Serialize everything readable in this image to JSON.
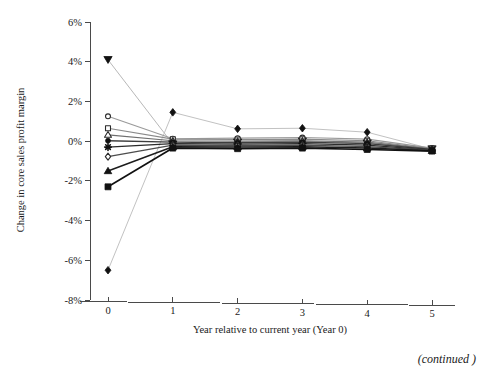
{
  "figure": {
    "continued_note": "(continued )"
  },
  "chart_data": {
    "type": "line",
    "title": "",
    "xlabel": "Year relative to current year (Year 0)",
    "ylabel": "Change in core sales profit margin",
    "x": [
      0,
      1,
      2,
      3,
      4,
      5
    ],
    "xtick_labels": [
      "0",
      "1",
      "2",
      "3",
      "4",
      "5"
    ],
    "xlim": [
      -0.25,
      5.35
    ],
    "ylim": [
      -8,
      6
    ],
    "ytick_values": [
      6,
      4,
      2,
      0,
      -2,
      -4,
      -6,
      -8
    ],
    "ytick_labels": [
      "6%",
      "4%",
      "2%",
      "0%",
      "-2%",
      "-4%",
      "-6%",
      "-8%"
    ],
    "grid": false,
    "legend": "none",
    "series": [
      {
        "name": "series-filled-down-triangle",
        "marker": "filled-down-triangle",
        "color": "#111111",
        "line_color": "#b8b8b8",
        "line_width": 1.0,
        "marker_size": 5.0,
        "values": [
          4.1,
          -0.15,
          -0.05,
          0.0,
          -0.1,
          -0.4
        ]
      },
      {
        "name": "series-filled-diamond",
        "marker": "filled-diamond",
        "color": "#111111",
        "line_color": "#c2c2c2",
        "line_width": 1.0,
        "marker_size": 4.6,
        "values": [
          -6.5,
          1.45,
          0.62,
          0.65,
          0.45,
          -0.4
        ]
      },
      {
        "name": "series-open-circle",
        "marker": "open-circle",
        "color": "#2a2a2a",
        "line_color": "#9a9a9a",
        "line_width": 1.1,
        "marker_size": 4.0,
        "values": [
          1.25,
          0.12,
          0.15,
          0.18,
          0.1,
          -0.35
        ]
      },
      {
        "name": "series-open-square",
        "marker": "open-square",
        "color": "#2a2a2a",
        "line_color": "#8a8a8a",
        "line_width": 1.1,
        "marker_size": 4.0,
        "values": [
          0.65,
          0.1,
          0.08,
          0.1,
          0.02,
          -0.38
        ]
      },
      {
        "name": "series-open-triangle",
        "marker": "open-triangle",
        "color": "#2a2a2a",
        "line_color": "#6f6f6f",
        "line_width": 1.2,
        "marker_size": 4.2,
        "values": [
          0.32,
          0.02,
          0.0,
          0.02,
          -0.05,
          -0.4
        ]
      },
      {
        "name": "series-filled-circle",
        "marker": "filled-circle",
        "color": "#111111",
        "line_color": "#3d3d3d",
        "line_width": 1.3,
        "marker_size": 4.0,
        "values": [
          0.02,
          -0.05,
          -0.08,
          -0.05,
          -0.12,
          -0.42
        ]
      },
      {
        "name": "series-filled-star",
        "marker": "filled-star",
        "color": "#111111",
        "line_color": "#2b2b2b",
        "line_width": 1.3,
        "marker_size": 4.4,
        "values": [
          -0.3,
          -0.12,
          -0.15,
          -0.12,
          -0.2,
          -0.45
        ]
      },
      {
        "name": "series-open-diamond",
        "marker": "open-diamond",
        "color": "#2a2a2a",
        "line_color": "#4d4d4d",
        "line_width": 1.3,
        "marker_size": 4.2,
        "values": [
          -0.78,
          -0.2,
          -0.22,
          -0.2,
          -0.28,
          -0.45
        ]
      },
      {
        "name": "series-filled-triangle",
        "marker": "filled-triangle",
        "color": "#111111",
        "line_color": "#1c1c1c",
        "line_width": 1.5,
        "marker_size": 4.6,
        "values": [
          -1.5,
          -0.28,
          -0.3,
          -0.28,
          -0.35,
          -0.48
        ]
      },
      {
        "name": "series-filled-square",
        "marker": "filled-square",
        "color": "#111111",
        "line_color": "#111111",
        "line_width": 1.7,
        "marker_size": 4.8,
        "values": [
          -2.3,
          -0.35,
          -0.38,
          -0.35,
          -0.42,
          -0.5
        ]
      }
    ]
  }
}
